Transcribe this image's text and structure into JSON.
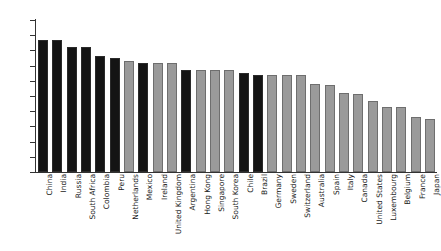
{
  "chart_data": {
    "type": "bar",
    "title": "",
    "subtitle": "",
    "xlabel": "",
    "ylabel": "",
    "ylim": [
      0,
      100
    ],
    "yticks": [
      0,
      10,
      20,
      30,
      40,
      50,
      60,
      70,
      80,
      90,
      100
    ],
    "grid": false,
    "legend": "none",
    "orientation": "vertical",
    "categories": [
      "China",
      "India",
      "Russia",
      "South Africa",
      "Colombia",
      "Peru",
      "Netherlands",
      "Mexico",
      "Ireland",
      "United Kingdom",
      "Argentina",
      "Hong Kong",
      "Singapore",
      "South Korea",
      "Chile",
      "Brazil",
      "Germany",
      "Sweden",
      "Switzerland",
      "Australia",
      "Spain",
      "Italy",
      "Canada",
      "United States",
      "Luxembourg",
      "Belgium",
      "France",
      "Japan"
    ],
    "values": [
      87,
      87,
      82,
      82,
      76,
      75,
      73,
      72,
      71.5,
      71.5,
      67,
      67,
      67,
      67,
      65,
      64,
      64,
      64,
      64,
      58,
      57,
      52,
      51,
      47,
      43,
      43,
      36,
      35
    ],
    "bar_colors": [
      "dark",
      "dark",
      "dark",
      "dark",
      "dark",
      "dark",
      "light",
      "dark",
      "light",
      "light",
      "dark",
      "light",
      "light",
      "light",
      "dark",
      "dark",
      "light",
      "light",
      "light",
      "light",
      "light",
      "light",
      "light",
      "light",
      "light",
      "light",
      "light",
      "light"
    ]
  },
  "colors": {
    "dark_bar": "#141414",
    "light_bar": "#9a9a9a",
    "axis": "#333333",
    "text": "#1a1a1a",
    "background": "#ffffff"
  }
}
